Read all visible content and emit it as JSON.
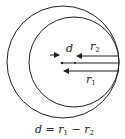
{
  "diagram": {
    "labels": {
      "d": "d",
      "r2_main": "r",
      "r2_sub": "2",
      "r1_main": "r",
      "r1_sub": "1"
    },
    "caption": {
      "d": "d",
      "eq": " = ",
      "r1": "r",
      "r1_sub": "1",
      "minus": " − ",
      "r2": "r",
      "r2_sub": "2"
    },
    "colors": {
      "stroke": "#222222",
      "background": "#ffffff"
    }
  }
}
